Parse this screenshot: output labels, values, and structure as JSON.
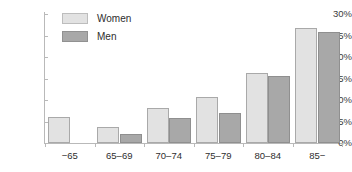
{
  "chart_data": {
    "type": "bar",
    "title": "",
    "subtitle": "",
    "xlabel": "",
    "ylabel": "",
    "categories": [
      "−65",
      "65–69",
      "70–74",
      "75–79",
      "80–84",
      "85−"
    ],
    "series": [
      {
        "name": "Women",
        "color": "#e2e2e2",
        "values": [
          6.0,
          3.8,
          8.2,
          10.7,
          16.2,
          26.8
        ]
      },
      {
        "name": "Men",
        "color": "#a8a8a8",
        "values": [
          0.0,
          2.2,
          5.8,
          6.9,
          15.6,
          25.8
        ]
      }
    ],
    "ylim": [
      0,
      30
    ],
    "yticks": [
      0,
      5,
      10,
      15,
      20,
      25,
      30
    ],
    "ytick_labels": [
      "0%",
      "5%",
      "10%",
      "15%",
      "20%",
      "25%",
      "30%"
    ],
    "grid": false,
    "legend_position": "top-left",
    "legend": [
      "Women",
      "Men"
    ]
  },
  "legend": {
    "items": [
      {
        "label": "Women"
      },
      {
        "label": "Men"
      }
    ]
  }
}
